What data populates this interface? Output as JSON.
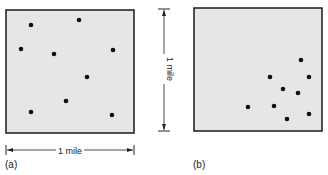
{
  "panels": [
    {
      "id": "a",
      "label": "(a)",
      "box": {
        "x": 6,
        "y": 10,
        "w": 128,
        "h": 123
      },
      "pattern": "dispersed",
      "points": [
        [
          31,
          25
        ],
        [
          79,
          20
        ],
        [
          21,
          49
        ],
        [
          54,
          54
        ],
        [
          113,
          50
        ],
        [
          87,
          77
        ],
        [
          66,
          101
        ],
        [
          31,
          112
        ],
        [
          112,
          115
        ]
      ]
    },
    {
      "id": "b",
      "label": "(b)",
      "box": {
        "x": 194,
        "y": 8,
        "w": 128,
        "h": 123
      },
      "pattern": "clustered",
      "points": [
        [
          301,
          60
        ],
        [
          270,
          77
        ],
        [
          309,
          77
        ],
        [
          283,
          89
        ],
        [
          298,
          93
        ],
        [
          248,
          107
        ],
        [
          274,
          106
        ],
        [
          287,
          119
        ],
        [
          309,
          114
        ]
      ]
    }
  ],
  "scale_horizontal": {
    "text": "1 mile"
  },
  "scale_vertical": {
    "text": "1 mile"
  },
  "colors": {
    "box_fill": "#e6e6e6",
    "box_stroke": "#1a1a1a",
    "dot": "#111111"
  }
}
